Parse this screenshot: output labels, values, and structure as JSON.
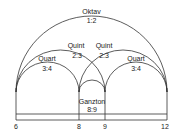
{
  "diagram": {
    "colors": {
      "stroke": "#333333",
      "text": "#222222",
      "background": "#ffffff"
    },
    "intervals": [
      {
        "name": "Oktav",
        "ratio": "1:2",
        "from": "6",
        "to": "12"
      },
      {
        "name": "Quint",
        "ratio": "2:3",
        "from": "6",
        "to": "9"
      },
      {
        "name": "Quint",
        "ratio": "2:3",
        "from": "8",
        "to": "12"
      },
      {
        "name": "Quart",
        "ratio": "3:4",
        "from": "6",
        "to": "8"
      },
      {
        "name": "Quart",
        "ratio": "3:4",
        "from": "9",
        "to": "12"
      },
      {
        "name": "Ganzton",
        "ratio": "8:9",
        "from": "8",
        "to": "9"
      }
    ],
    "ticks": [
      "6",
      "8",
      "9",
      "12"
    ]
  }
}
